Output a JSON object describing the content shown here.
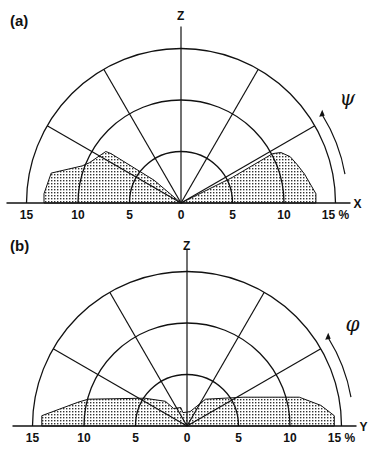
{
  "chart_data": [
    {
      "panel": "(a)",
      "type": "polar-area",
      "vertical_axis_label": "Z",
      "horizontal_axis_label": "X",
      "angle_symbol": "ψ",
      "unit": "%",
      "radial_ticks": [
        15,
        10,
        5,
        0,
        5,
        10,
        15
      ],
      "rings": [
        5,
        10,
        15
      ],
      "ray_angles_deg": [
        30,
        60,
        90,
        120,
        150
      ],
      "rlim": [
        0,
        15
      ],
      "series": [
        {
          "name": "left lobe",
          "points_xy": [
            [
              0,
              0
            ],
            [
              -13.3,
              0
            ],
            [
              -13.3,
              0.9
            ],
            [
              -12.6,
              2.9
            ],
            [
              -9.6,
              3.6
            ],
            [
              -8.9,
              3.9
            ],
            [
              -7.3,
              5.0
            ],
            [
              -6.8,
              4.8
            ],
            [
              -2.6,
              2.2
            ],
            [
              0,
              0
            ]
          ]
        },
        {
          "name": "right lobe",
          "points_xy": [
            [
              0,
              0
            ],
            [
              5.0,
              2.5
            ],
            [
              8.9,
              4.8
            ],
            [
              9.7,
              4.9
            ],
            [
              10.6,
              4.5
            ],
            [
              11.3,
              3.7
            ],
            [
              12.0,
              2.8
            ],
            [
              13.1,
              0.9
            ],
            [
              13.1,
              0
            ],
            [
              0,
              0
            ]
          ]
        }
      ]
    },
    {
      "panel": "(b)",
      "type": "polar-area",
      "vertical_axis_label": "Z",
      "horizontal_axis_label": "Y",
      "angle_symbol": "φ",
      "unit": "%",
      "radial_ticks": [
        15,
        10,
        5,
        0,
        5,
        10,
        15
      ],
      "rings": [
        5,
        10,
        15
      ],
      "ray_angles_deg": [
        30,
        60,
        90,
        120,
        150
      ],
      "rlim": [
        0,
        15
      ],
      "series": [
        {
          "name": "distribution",
          "points_xy": [
            [
              -14.1,
              0
            ],
            [
              -14.1,
              1.0
            ],
            [
              -10.6,
              2.3
            ],
            [
              -9.6,
              2.6
            ],
            [
              -4.1,
              2.7
            ],
            [
              -2.1,
              2.4
            ],
            [
              -1.3,
              1.7
            ],
            [
              -0.6,
              1.8
            ],
            [
              -0.4,
              1.3
            ],
            [
              0.3,
              1.4
            ],
            [
              1.8,
              2.6
            ],
            [
              5.5,
              2.8
            ],
            [
              10.9,
              2.8
            ],
            [
              13.0,
              2.0
            ],
            [
              14.3,
              1.0
            ],
            [
              14.3,
              0
            ],
            [
              -14.1,
              0
            ]
          ]
        }
      ]
    }
  ]
}
